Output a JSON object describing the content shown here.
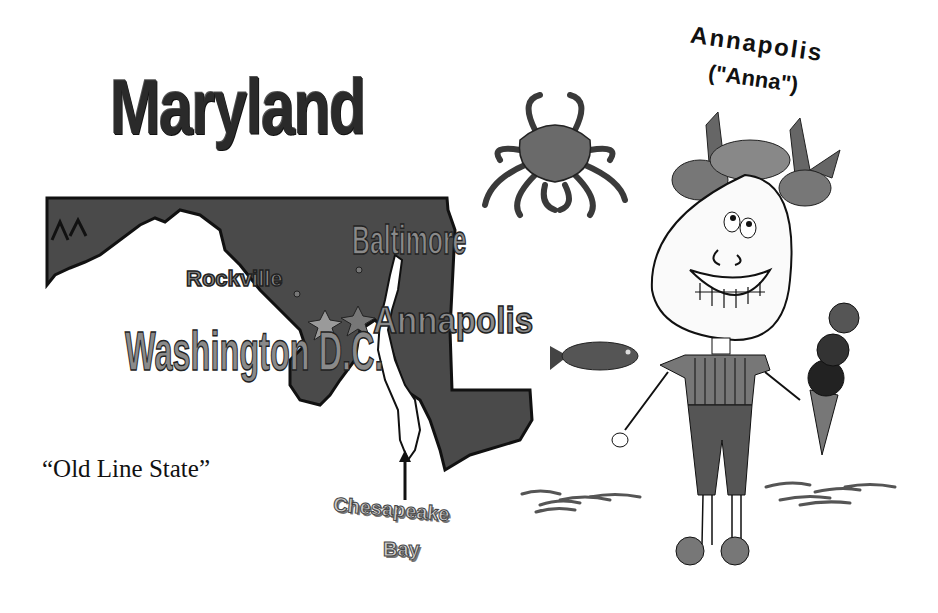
{
  "title": "Maryland",
  "nickname": "“Old Line State”",
  "character": {
    "name": "Annapolis",
    "nickname": "(\"Anna\")"
  },
  "map": {
    "cities": [
      {
        "label": "Baltimore"
      },
      {
        "label": "Rockville"
      },
      {
        "label": "Annapolis"
      },
      {
        "label": "Washington D.C."
      }
    ],
    "bay_label_line1": "Chesapeake",
    "bay_label_line2": "Bay"
  },
  "illustrations": [
    "crab-icon",
    "fish-icon",
    "girl-character",
    "ice-cream-cone",
    "wave-lines"
  ],
  "colors": {
    "map_fill": "#4a4a4a",
    "label_fill": "#8a8a8a",
    "background": "#ffffff"
  }
}
